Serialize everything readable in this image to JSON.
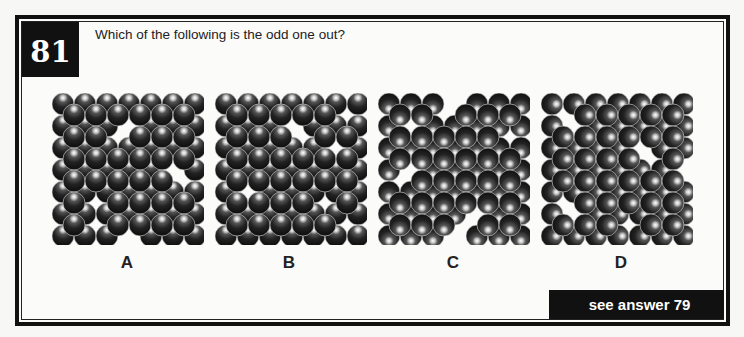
{
  "puzzle": {
    "number": "81",
    "question": "Which of the following is the odd one out?",
    "answer_link": "see answer 79"
  },
  "colors": {
    "frame": "#111111",
    "ball_dark": "#111111",
    "ball_mid": "#555555",
    "ball_highlight": "#ffffff",
    "background": "#fbfbfa"
  },
  "options": [
    {
      "label": "A",
      "light_direction": "top",
      "grid": {
        "back_rows": 7,
        "back_cols": 7,
        "front_rows": 6,
        "front_cols": 6
      },
      "missing_back": [
        [
          1,
          3
        ],
        [
          3,
          5
        ],
        [
          6,
          3
        ]
      ],
      "missing_front": [
        [
          1,
          2
        ],
        [
          3,
          5
        ],
        [
          4,
          1
        ],
        [
          5,
          1
        ]
      ]
    },
    {
      "label": "B",
      "light_direction": "top",
      "grid": {
        "back_rows": 7,
        "back_cols": 7,
        "front_rows": 6,
        "front_cols": 6
      },
      "missing_back": [
        [
          1,
          3
        ],
        [
          2,
          5
        ],
        [
          4,
          1
        ]
      ],
      "missing_front": [
        [
          0,
          5
        ],
        [
          1,
          3
        ],
        [
          4,
          4
        ],
        [
          5,
          5
        ]
      ]
    },
    {
      "label": "C",
      "light_direction": "bottom",
      "grid": {
        "back_rows": 7,
        "back_cols": 7,
        "front_rows": 6,
        "front_cols": 6
      },
      "missing_back": [
        [
          0,
          3
        ],
        [
          1,
          1
        ],
        [
          3,
          1
        ],
        [
          5,
          4
        ],
        [
          6,
          3
        ]
      ],
      "missing_front": [
        [
          0,
          2
        ],
        [
          1,
          5
        ],
        [
          3,
          0
        ],
        [
          5,
          3
        ]
      ]
    },
    {
      "label": "D",
      "light_direction": "right",
      "grid": {
        "back_rows": 7,
        "back_cols": 7,
        "front_rows": 6,
        "front_cols": 6
      },
      "missing_back": [
        [
          1,
          1
        ],
        [
          2,
          4
        ],
        [
          3,
          6
        ],
        [
          5,
          1
        ]
      ],
      "missing_front": [
        [
          0,
          0
        ],
        [
          2,
          4
        ],
        [
          4,
          0
        ],
        [
          5,
          3
        ]
      ]
    }
  ]
}
